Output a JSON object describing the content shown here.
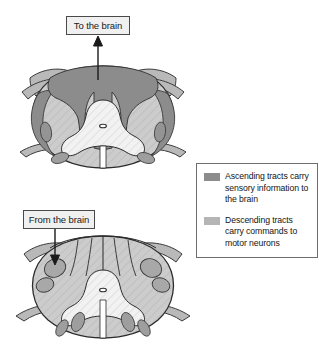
{
  "figure": {
    "background_color": "#ffffff"
  },
  "callouts": [
    {
      "id": "to-the-brain",
      "label": "To the brain",
      "direction": "up",
      "box": {
        "x": 66,
        "y": 16,
        "w": 64,
        "h": 19
      },
      "arrow": {
        "x": 98,
        "from_y": 78,
        "to_y": 37
      }
    },
    {
      "id": "from-the-brain",
      "label": "From the brain",
      "direction": "down",
      "box": {
        "x": 23,
        "y": 210,
        "w": 72,
        "h": 19
      },
      "arrow": {
        "x": 55,
        "from_y": 229,
        "to_y": 262
      }
    }
  ],
  "legend": {
    "border_color": "#6e6e6e",
    "items": [
      {
        "swatch_color": "#8c8c8c",
        "swatch_name": "ascending-tract-swatch",
        "text": "Ascending tracts carry sensory information to the brain",
        "lines": [
          "Ascending tracts carry",
          "sensory information to",
          "the brain"
        ]
      },
      {
        "swatch_color": "#b5b5b5",
        "swatch_name": "descending-tract-swatch",
        "text": "Descending tracts carry commands to motor neurons",
        "lines": [
          "Descending tracts carry",
          "commands to motor",
          "neurons"
        ]
      }
    ]
  },
  "diagrams": [
    {
      "id": "upper-cord",
      "caption": "Cross section highlighting ascending (sensory) tracts",
      "highlight_color": "#8c8c8c",
      "white_matter_color": "#c9c9c9",
      "gray_matter_color": "#f2f2f2",
      "outline_color": "#2b2b2b",
      "center": {
        "x": 103,
        "y": 120
      }
    },
    {
      "id": "lower-cord",
      "caption": "Cross section highlighting descending (motor) tracts",
      "highlight_color": "#a8a8a8",
      "white_matter_color": "#c9c9c9",
      "gray_matter_color": "#f2f2f2",
      "outline_color": "#2b2b2b",
      "center": {
        "x": 103,
        "y": 290
      }
    }
  ],
  "colors": {
    "ascending": "#8c8c8c",
    "descending": "#a8a8a8",
    "white_matter": "#c9c9c9",
    "gray_matter": "#f4f4f4",
    "dura": "#aeaeae",
    "outline": "#2b2b2b",
    "callout_fill": "#f0f0f0",
    "callout_border": "#4a4a4a",
    "page": "#ffffff"
  }
}
